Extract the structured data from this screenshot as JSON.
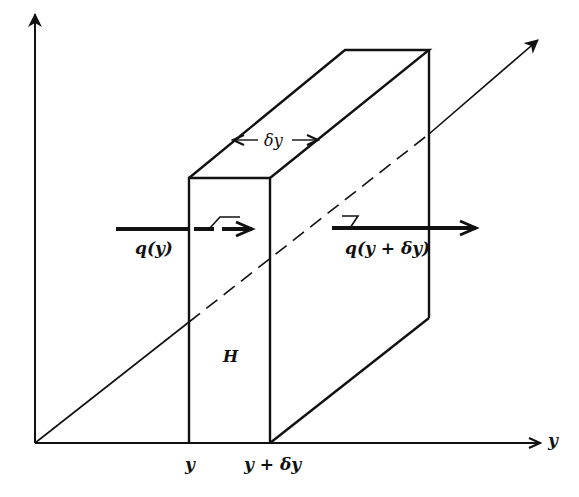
{
  "diagram": {
    "type": "3d-control-volume",
    "axes": {
      "vertical": {
        "label": ""
      },
      "horizontal": {
        "label": "y"
      },
      "depth": {
        "label": ""
      }
    },
    "labels": {
      "width": "δy",
      "flux_in": "q(y)",
      "flux_out": "q(y + δy)",
      "height": "H",
      "tick_left": "y",
      "tick_right": "y + δy",
      "axis_y": "y"
    },
    "colors": {
      "stroke": "#111111",
      "background": "#ffffff"
    }
  }
}
